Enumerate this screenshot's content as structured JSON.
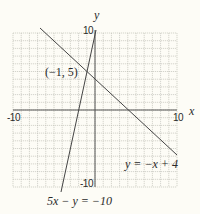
{
  "axes": {
    "x_label": "x",
    "y_label": "y",
    "x_min_label": "-10",
    "x_max_label": "10",
    "y_max_label": "10",
    "y_min_label": "-10"
  },
  "annotations": {
    "intersection_point": "(−1, 5)",
    "line1_equation": "y = −x + 4",
    "line2_equation": "5x − y = −10"
  },
  "colors": {
    "background": "#fdfcf6",
    "grid": "#b8b8b0",
    "axis": "#555555",
    "line": "#444444"
  },
  "chart_data": {
    "type": "line",
    "title": "",
    "xlabel": "x",
    "ylabel": "y",
    "xlim": [
      -10,
      10
    ],
    "ylim": [
      -10,
      10
    ],
    "grid": true,
    "series": [
      {
        "name": "y = −x + 4",
        "x": [
          -7,
          10
        ],
        "y": [
          11,
          -6
        ]
      },
      {
        "name": "5x − y = −10",
        "x": [
          -4.2,
          -0.4
        ],
        "y": [
          -11,
          8
        ]
      }
    ],
    "annotations": [
      {
        "text": "(−1, 5)",
        "x": -1,
        "y": 5
      }
    ]
  }
}
